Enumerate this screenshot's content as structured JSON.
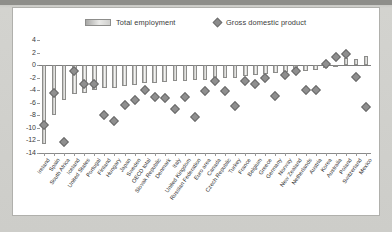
{
  "legend": {
    "series_bar": "Total employment",
    "series_marker": "Gross domestic product",
    "bar_swatch_icon": "bar-swatch-icon",
    "marker_swatch_icon": "diamond-marker-icon"
  },
  "axis": {
    "yticks": [
      "4",
      "2",
      "0",
      "-2",
      "-4",
      "-6",
      "-8",
      "-10",
      "-12",
      "-14"
    ],
    "ymin": -14,
    "ymax": 4
  },
  "chart_data": {
    "type": "bar",
    "title": "",
    "subtitle": "",
    "xlabel": "",
    "ylabel": "",
    "ylim": [
      -14,
      4
    ],
    "grid": false,
    "legend_position": "top",
    "categories": [
      "Ireland",
      "Spain",
      "South Africa",
      "Iceland",
      "United States",
      "Portugal",
      "Finland",
      "Hungary",
      "Japan",
      "Sweden",
      "OECD total",
      "Slovak Republic",
      "Denmark",
      "Italy",
      "United Kingdom",
      "Russian Federation",
      "Euro area",
      "Canada",
      "Czech Republic",
      "Turkey",
      "France",
      "Belgium",
      "Greece",
      "Germany",
      "Norway",
      "New Zealand",
      "Netherlands",
      "Austria",
      "Korea",
      "Australia",
      "Poland",
      "Switzerland",
      "Mexico"
    ],
    "series": [
      {
        "name": "Total employment",
        "type": "bar",
        "values": [
          -12.6,
          -8.0,
          -5.6,
          -4.6,
          -4.4,
          -4.0,
          -3.7,
          -3.6,
          -3.4,
          -3.2,
          -2.9,
          -2.8,
          -2.7,
          -2.6,
          -2.5,
          -2.4,
          -2.3,
          -2.2,
          -2.1,
          -2.0,
          -1.8,
          -1.6,
          -1.4,
          -1.2,
          -1.1,
          -1.0,
          -0.9,
          -0.7,
          -0.5,
          -0.3,
          1.1,
          1.0,
          1.5
        ]
      },
      {
        "name": "Gross domestic product",
        "type": "scatter",
        "values": [
          -9.6,
          -4.5,
          -12.2,
          -1.0,
          -3.0,
          -3.0,
          -8.0,
          -8.9,
          -6.3,
          -5.5,
          -4.0,
          -5.0,
          -5.2,
          -7.0,
          -5.1,
          -8.2,
          -4.2,
          -2.6,
          -4.2,
          -6.5,
          -2.6,
          -3.0,
          -2.0,
          -4.9,
          -1.5,
          -1.0,
          -4.0,
          -3.9,
          0.2,
          1.3,
          1.7,
          -1.9,
          -6.6
        ]
      }
    ]
  }
}
